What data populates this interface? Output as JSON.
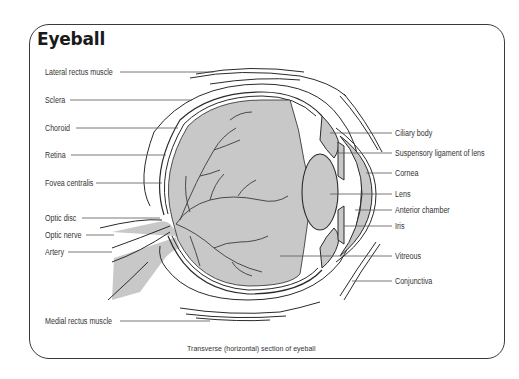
{
  "title": "Eyeball",
  "caption": "Transverse (horizontal) section of eyeball",
  "labels_left": [
    {
      "id": "lateral-rectus-muscle",
      "text": "Lateral rectus muscle"
    },
    {
      "id": "sclera",
      "text": "Sclera"
    },
    {
      "id": "choroid",
      "text": "Choroid"
    },
    {
      "id": "retina",
      "text": "Retina"
    },
    {
      "id": "fovea-centralis",
      "text": "Fovea centralis"
    },
    {
      "id": "optic-disc",
      "text": "Optic disc"
    },
    {
      "id": "optic-nerve",
      "text": "Optic nerve"
    },
    {
      "id": "artery",
      "text": "Artery"
    },
    {
      "id": "medial-rectus-muscle",
      "text": "Medial rectus muscle"
    }
  ],
  "labels_right": [
    {
      "id": "ciliary-body",
      "text": "Ciliary body"
    },
    {
      "id": "suspensory-ligament",
      "text": "Suspensory ligament of lens"
    },
    {
      "id": "cornea",
      "text": "Cornea"
    },
    {
      "id": "lens",
      "text": "Lens"
    },
    {
      "id": "anterior-chamber",
      "text": "Anterior chamber"
    },
    {
      "id": "iris",
      "text": "Iris"
    },
    {
      "id": "vitreous",
      "text": "Vitreous"
    },
    {
      "id": "conjunctiva",
      "text": "Conjunctiva"
    }
  ],
  "colors": {
    "tissue_fill": "#c8c8c8",
    "line": "#2a2a2a",
    "frame": "#3a3a3a"
  }
}
